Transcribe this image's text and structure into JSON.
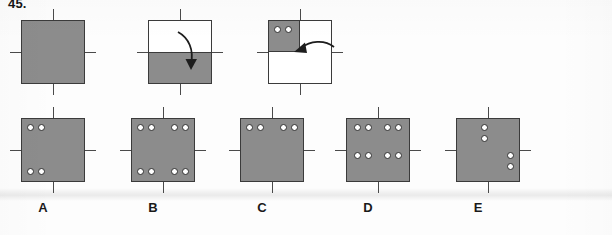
{
  "question": {
    "number": "45."
  },
  "colors": {
    "paper_shaded": "#8c8c8c",
    "paper_open": "#ffffff",
    "outline": "#3b3b3b",
    "hole_fill": "#ffffff",
    "hole_outline": "#2f2f2f",
    "label_text": "#1a1a1a",
    "background": "#fdfdfd"
  },
  "prompt_row": {
    "name": "folding-sequence",
    "steps": [
      {
        "id": "step-1",
        "state_label": "unfolded-sheet",
        "square": {
          "x": 21,
          "y": 20,
          "size": 64
        },
        "fill": "shaded",
        "shaded_regions": [],
        "holes": [],
        "ticks": [
          "top",
          "bottom",
          "left",
          "right"
        ],
        "arrow": null
      },
      {
        "id": "step-2",
        "state_label": "folded-bottom-half",
        "square": {
          "x": 148,
          "y": 20,
          "size": 64
        },
        "fill": "open",
        "shaded_regions": [
          {
            "x": 0,
            "y": 32,
            "w": 64,
            "h": 32
          }
        ],
        "holes": [],
        "ticks": [
          "top",
          "bottom",
          "left",
          "right"
        ],
        "arrow": {
          "kind": "fold-down-arrow",
          "direction": "down"
        }
      },
      {
        "id": "step-3",
        "state_label": "folded-quarter-punched",
        "square": {
          "x": 268,
          "y": 20,
          "size": 64
        },
        "fill": "open",
        "shaded_regions": [
          {
            "x": 0,
            "y": 0,
            "w": 32,
            "h": 32
          }
        ],
        "holes": [
          {
            "x": 6,
            "y": 6
          },
          {
            "x": 17,
            "y": 6
          }
        ],
        "ticks": [
          "top",
          "bottom",
          "left",
          "right"
        ],
        "arrow": {
          "kind": "fold-left-arrow",
          "direction": "left"
        }
      }
    ]
  },
  "answer_row": {
    "name": "answer-options",
    "options": [
      {
        "id": "option-a",
        "label": "A",
        "label_x": 43,
        "square": {
          "x": 21,
          "y": 118,
          "size": 64
        },
        "ticks": [
          "top",
          "bottom",
          "left",
          "right"
        ],
        "holes": [
          {
            "x": 6,
            "y": 6
          },
          {
            "x": 17,
            "y": 6
          },
          {
            "x": 6,
            "y": 50
          },
          {
            "x": 17,
            "y": 50
          }
        ]
      },
      {
        "id": "option-b",
        "label": "B",
        "label_x": 153,
        "square": {
          "x": 131,
          "y": 118,
          "size": 64
        },
        "ticks": [
          "top",
          "bottom",
          "left",
          "right"
        ],
        "holes": [
          {
            "x": 6,
            "y": 6
          },
          {
            "x": 17,
            "y": 6
          },
          {
            "x": 40,
            "y": 6
          },
          {
            "x": 51,
            "y": 6
          },
          {
            "x": 6,
            "y": 50
          },
          {
            "x": 17,
            "y": 50
          },
          {
            "x": 40,
            "y": 50
          },
          {
            "x": 51,
            "y": 50
          }
        ]
      },
      {
        "id": "option-c",
        "label": "C",
        "label_x": 262,
        "square": {
          "x": 240,
          "y": 118,
          "size": 64
        },
        "ticks": [
          "top",
          "bottom",
          "left",
          "right"
        ],
        "holes": [
          {
            "x": 6,
            "y": 6
          },
          {
            "x": 17,
            "y": 6
          },
          {
            "x": 40,
            "y": 6
          },
          {
            "x": 51,
            "y": 6
          }
        ]
      },
      {
        "id": "option-d",
        "label": "D",
        "label_x": 368,
        "square": {
          "x": 346,
          "y": 118,
          "size": 64
        },
        "ticks": [
          "top",
          "bottom",
          "left",
          "right"
        ],
        "holes": [
          {
            "x": 8,
            "y": 6
          },
          {
            "x": 19,
            "y": 6
          },
          {
            "x": 38,
            "y": 6
          },
          {
            "x": 49,
            "y": 6
          },
          {
            "x": 8,
            "y": 34
          },
          {
            "x": 19,
            "y": 34
          },
          {
            "x": 38,
            "y": 34
          },
          {
            "x": 49,
            "y": 34
          }
        ]
      },
      {
        "id": "option-e",
        "label": "E",
        "label_x": 478,
        "square": {
          "x": 456,
          "y": 118,
          "size": 64
        },
        "ticks": [
          "top",
          "bottom",
          "left",
          "right"
        ],
        "holes": [
          {
            "x": 25,
            "y": 6
          },
          {
            "x": 25,
            "y": 17
          },
          {
            "x": 51,
            "y": 34
          },
          {
            "x": 51,
            "y": 45
          }
        ]
      }
    ]
  }
}
